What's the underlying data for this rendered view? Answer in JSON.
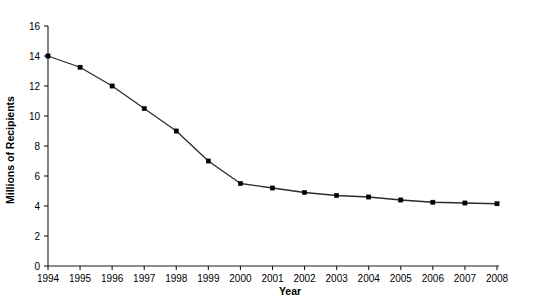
{
  "chart_data": {
    "type": "line",
    "title": "",
    "xlabel": "Year",
    "ylabel": "Millions of Recipients",
    "categories": [
      "1994",
      "1995",
      "1996",
      "1997",
      "1998",
      "1999",
      "2000",
      "2001",
      "2002",
      "2003",
      "2004",
      "2005",
      "2006",
      "2007",
      "2008"
    ],
    "x": [
      1994,
      1995,
      1996,
      1997,
      1998,
      1999,
      2000,
      2001,
      2002,
      2003,
      2004,
      2005,
      2006,
      2007,
      2008
    ],
    "values": [
      14.0,
      13.25,
      12.0,
      10.5,
      9.0,
      7.0,
      5.5,
      5.2,
      4.9,
      4.7,
      4.6,
      4.4,
      4.25,
      4.2,
      4.15
    ],
    "series": [
      {
        "name": "Millions of Recipients",
        "values": [
          14.0,
          13.25,
          12.0,
          10.5,
          9.0,
          7.0,
          5.5,
          5.2,
          4.9,
          4.7,
          4.6,
          4.4,
          4.25,
          4.2,
          4.15
        ]
      }
    ],
    "xlim": [
      1994,
      2008
    ],
    "ylim": [
      0,
      16
    ],
    "yticks": [
      0,
      2,
      4,
      6,
      8,
      10,
      12,
      14,
      16
    ],
    "ytick_labels": [
      "0",
      "2",
      "4",
      "6",
      "8",
      "10",
      "12",
      "14",
      "16"
    ],
    "xticks": [
      1994,
      1995,
      1996,
      1997,
      1998,
      1999,
      2000,
      2001,
      2002,
      2003,
      2004,
      2005,
      2006,
      2007,
      2008
    ],
    "xtick_labels": [
      "1994",
      "1995",
      "1996",
      "1997",
      "1998",
      "1999",
      "2000",
      "2001",
      "2002",
      "2003",
      "2004",
      "2005",
      "2006",
      "2007",
      "2008"
    ],
    "grid": false,
    "legend": false,
    "legend_position": "none",
    "marker": "filled-square",
    "line_color": "#2b2b2b",
    "marker_color": "#000000",
    "background_color": "#ffffff"
  }
}
